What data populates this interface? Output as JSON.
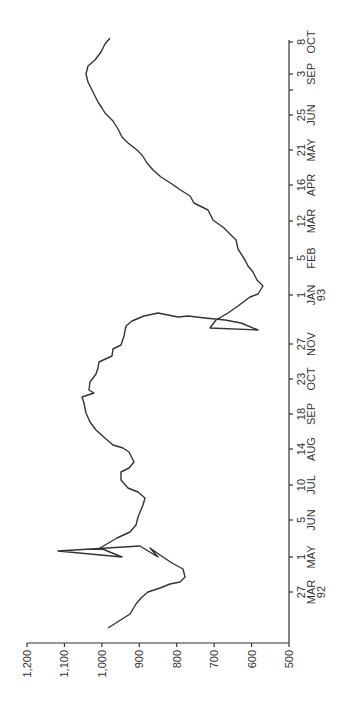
{
  "chart_data": {
    "type": "line",
    "orientation": "rotated-90-ccw",
    "title": "",
    "xlabel": "",
    "ylabel": "",
    "ylim": [
      500,
      1200
    ],
    "y_ticks": [
      "1,200",
      "1,100",
      "1,000",
      "900",
      "800",
      "700",
      "600",
      "500"
    ],
    "x_ticks": [
      {
        "day": "27",
        "month": "MAR",
        "year": "92"
      },
      {
        "day": "1",
        "month": "MAY",
        "year": ""
      },
      {
        "day": "5",
        "month": "JUN",
        "year": ""
      },
      {
        "day": "10",
        "month": "JUL",
        "year": ""
      },
      {
        "day": "14",
        "month": "AUG",
        "year": ""
      },
      {
        "day": "18",
        "month": "SEP",
        "year": ""
      },
      {
        "day": "23",
        "month": "OCT",
        "year": ""
      },
      {
        "day": "27",
        "month": "NOV",
        "year": ""
      },
      {
        "day": "1",
        "month": "JAN",
        "year": "93"
      },
      {
        "day": "5",
        "month": "FEB",
        "year": ""
      },
      {
        "day": "12",
        "month": "MAR",
        "year": ""
      },
      {
        "day": "16",
        "month": "APR",
        "year": ""
      },
      {
        "day": "21",
        "month": "MAY",
        "year": ""
      },
      {
        "day": "25",
        "month": "JUN",
        "year": ""
      },
      {
        "day": "",
        "month": "",
        "year": ""
      },
      {
        "day": "3",
        "month": "SEP",
        "year": ""
      },
      {
        "day": "8",
        "month": "OCT",
        "year": ""
      }
    ],
    "grid": false,
    "legend": null,
    "series": [
      {
        "name": "series",
        "x_index": [
          0.0,
          -0.45,
          -0.3,
          -0.2,
          0.0,
          0.1,
          0.25,
          0.35,
          0.45,
          0.6,
          0.7,
          0.8,
          0.95,
          1.0,
          1.1,
          1.2,
          1.35,
          1.5,
          1.7,
          1.85,
          2.0,
          2.1,
          2.2,
          2.35,
          2.5,
          2.65,
          2.8,
          2.95,
          3.05,
          3.15,
          3.3,
          3.45,
          3.55,
          3.7,
          3.85,
          4.0,
          4.1,
          4.25,
          4.4,
          4.55,
          4.7,
          4.85,
          5.0,
          5.15,
          5.3,
          5.45,
          5.6,
          5.75,
          5.85,
          6.0,
          6.15,
          6.3,
          6.45,
          6.55,
          6.7,
          6.85,
          7.0,
          7.15,
          7.3,
          7.45,
          7.6,
          7.75,
          7.9,
          8.0,
          8.1,
          8.25,
          8.4,
          8.55,
          8.7,
          8.85,
          9.0,
          9.15,
          9.3,
          9.45,
          9.6,
          9.75,
          9.9,
          10.05,
          10.2,
          10.35,
          10.5,
          10.65,
          10.8,
          10.95,
          11.1,
          11.25,
          11.4,
          11.55,
          11.7,
          11.85,
          12.0,
          12.15,
          12.3,
          12.45,
          12.6,
          12.75,
          12.9,
          13.0,
          13.15,
          13.3,
          13.45,
          13.6,
          13.75,
          13.9,
          14.05,
          14.2,
          14.35,
          14.5,
          14.65,
          14.8,
          14.95,
          15.1,
          15.25,
          15.4,
          15.55,
          15.7,
          15.85,
          16.0
        ],
        "values": [
          835,
          985,
          940,
          920,
          900,
          880,
          860,
          835,
          815,
          815,
          850,
          880,
          910,
          945,
          880,
          1115,
          1055,
          1055,
          1065,
          1045,
          1025,
          1005,
          990,
          930,
          900,
          910,
          900,
          940,
          960,
          925,
          890,
          810,
          745,
          690,
          665,
          655,
          655,
          620,
          610,
          605,
          590,
          585,
          600,
          620,
          655,
          660,
          720,
          690,
          700,
          685,
          695,
          680,
          700,
          685,
          680,
          690,
          700,
          740,
          780,
          810,
          990,
          1005,
          1005,
          975,
          1010,
          1000,
          1000,
          1030,
          1080,
          1100,
          1140,
          1145,
          1090,
          1060,
          1030,
          1040,
          990,
          1040,
          990,
          1000,
          980,
          1030,
          1005,
          1010,
          990,
          985,
          990,
          980,
          970,
          985,
          970,
          855,
          850,
          830,
          815,
          805,
          815,
          810,
          805,
          770,
          750,
          740,
          730,
          720,
          710,
          690,
          700,
          690,
          675,
          665,
          655,
          640,
          630,
          620,
          610,
          600,
          590,
          570
        ]
      }
    ],
    "trace_px": [
      [
        108,
        628
      ],
      [
        130,
        614
      ],
      [
        136,
        604
      ],
      [
        141,
        598
      ],
      [
        148,
        592
      ],
      [
        160,
        588
      ],
      [
        170,
        584
      ],
      [
        180,
        582
      ],
      [
        185,
        577
      ],
      [
        183,
        569
      ],
      [
        172,
        563
      ],
      [
        160,
        555
      ],
      [
        150,
        548
      ],
      [
        158,
        557
      ],
      [
        140,
        546
      ],
      [
        140,
        546
      ],
      [
        58,
        551
      ],
      [
        122,
        557
      ],
      [
        100,
        548
      ],
      [
        117,
        538
      ],
      [
        130,
        532
      ],
      [
        136,
        525
      ],
      [
        138,
        517
      ],
      [
        143,
        505
      ],
      [
        145,
        498
      ],
      [
        138,
        492
      ],
      [
        128,
        488
      ],
      [
        121,
        480
      ],
      [
        121,
        472
      ],
      [
        129,
        468
      ],
      [
        134,
        462
      ],
      [
        129,
        452
      ],
      [
        123,
        448
      ],
      [
        113,
        445
      ],
      [
        106,
        439
      ],
      [
        96,
        430
      ],
      [
        90,
        422
      ],
      [
        86,
        413
      ],
      [
        84,
        403
      ],
      [
        82,
        397
      ],
      [
        94,
        393
      ],
      [
        89,
        390
      ],
      [
        90,
        382
      ],
      [
        96,
        374
      ],
      [
        98,
        368
      ],
      [
        99,
        362
      ],
      [
        112,
        356
      ],
      [
        113,
        349
      ],
      [
        121,
        345
      ],
      [
        124,
        336
      ],
      [
        126,
        326
      ],
      [
        132,
        321
      ],
      [
        144,
        316
      ],
      [
        158,
        313
      ],
      [
        178,
        317
      ],
      [
        188,
        316
      ],
      [
        205,
        318
      ],
      [
        225,
        320
      ],
      [
        241,
        323
      ],
      [
        258,
        330
      ],
      [
        210,
        328
      ],
      [
        216,
        320
      ],
      [
        228,
        313
      ],
      [
        238,
        306
      ],
      [
        250,
        297
      ],
      [
        258,
        294
      ],
      [
        263,
        286
      ],
      [
        257,
        280
      ],
      [
        253,
        272
      ],
      [
        248,
        266
      ],
      [
        245,
        260
      ],
      [
        238,
        249
      ],
      [
        236,
        240
      ],
      [
        224,
        228
      ],
      [
        213,
        220
      ],
      [
        208,
        210
      ],
      [
        194,
        203
      ],
      [
        190,
        196
      ],
      [
        179,
        189
      ],
      [
        172,
        184
      ],
      [
        161,
        177
      ],
      [
        153,
        170
      ],
      [
        147,
        163
      ],
      [
        142,
        155
      ],
      [
        137,
        150
      ],
      [
        128,
        143
      ],
      [
        122,
        137
      ],
      [
        118,
        129
      ],
      [
        113,
        121
      ],
      [
        105,
        113
      ],
      [
        102,
        108
      ],
      [
        98,
        102
      ],
      [
        95,
        96
      ],
      [
        92,
        90
      ],
      [
        88,
        82
      ],
      [
        86,
        74
      ],
      [
        88,
        66
      ],
      [
        95,
        60
      ],
      [
        101,
        52
      ],
      [
        105,
        44
      ],
      [
        110,
        38
      ]
    ]
  },
  "axes": {
    "value_axis_labels": [
      "1,200",
      "1,100",
      "1,000",
      "900",
      "800",
      "700",
      "600",
      "500"
    ],
    "date_axis_labels": [
      {
        "day": "27",
        "month": "MAR",
        "year": "92"
      },
      {
        "day": "1",
        "month": "MAY",
        "year": ""
      },
      {
        "day": "5",
        "month": "JUN",
        "year": ""
      },
      {
        "day": "10",
        "month": "JUL",
        "year": ""
      },
      {
        "day": "14",
        "month": "AUG",
        "year": ""
      },
      {
        "day": "18",
        "month": "SEP",
        "year": ""
      },
      {
        "day": "23",
        "month": "OCT",
        "year": ""
      },
      {
        "day": "27",
        "month": "NOV",
        "year": ""
      },
      {
        "day": "1",
        "month": "JAN",
        "year": "93"
      },
      {
        "day": "5",
        "month": "FEB",
        "year": ""
      },
      {
        "day": "12",
        "month": "MAR",
        "year": ""
      },
      {
        "day": "16",
        "month": "APR",
        "year": ""
      },
      {
        "day": "21",
        "month": "MAY",
        "year": ""
      },
      {
        "day": "25",
        "month": "JUN",
        "year": ""
      },
      {
        "day": "",
        "month": "",
        "year": ""
      },
      {
        "day": "3",
        "month": "SEP",
        "year": ""
      },
      {
        "day": "8",
        "month": "OCT",
        "year": ""
      }
    ]
  },
  "colors": {
    "line": "#333333",
    "axis": "#333333",
    "background": "#ffffff"
  }
}
